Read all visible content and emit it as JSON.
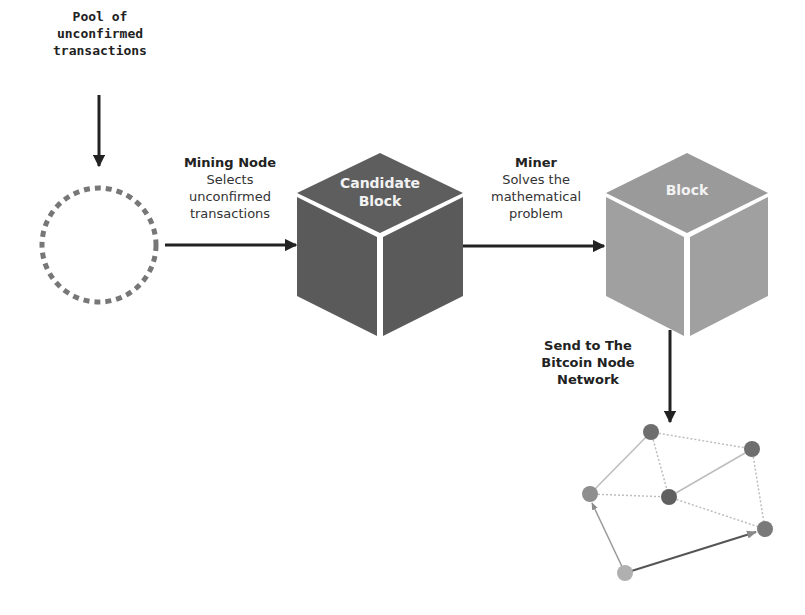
{
  "pool": {
    "lines": [
      "Pool of",
      "unconfirmed",
      "transactions"
    ]
  },
  "mining_node": {
    "title": "Mining Node",
    "lines": [
      "Selects",
      "unconfirmed",
      "transactions"
    ]
  },
  "candidate_block": {
    "lines": [
      "Candidate",
      "Block"
    ],
    "color": "#5e5e5e"
  },
  "miner": {
    "title": "Miner",
    "lines": [
      "Solves the",
      "mathematical",
      "problem"
    ]
  },
  "block": {
    "label": "Block",
    "color": "#9a9a9a"
  },
  "send": {
    "lines": [
      "Send to The",
      "Bitcoin Node",
      "Network"
    ]
  },
  "network": {
    "nodes": [
      {
        "id": "n1",
        "x": 651,
        "y": 432,
        "color": "#6e6e6e"
      },
      {
        "id": "n2",
        "x": 752,
        "y": 449,
        "color": "#6e6e6e"
      },
      {
        "id": "n3",
        "x": 590,
        "y": 494,
        "color": "#8e8e8e"
      },
      {
        "id": "n4",
        "x": 669,
        "y": 497,
        "color": "#606060"
      },
      {
        "id": "n5",
        "x": 765,
        "y": 529,
        "color": "#7a7a7a"
      },
      {
        "id": "n6",
        "x": 625,
        "y": 573,
        "color": "#b0b0b0"
      }
    ]
  },
  "colors": {
    "arrow": "#222222",
    "dashed_circle": "#777777",
    "edge": "#bdbdbd"
  }
}
